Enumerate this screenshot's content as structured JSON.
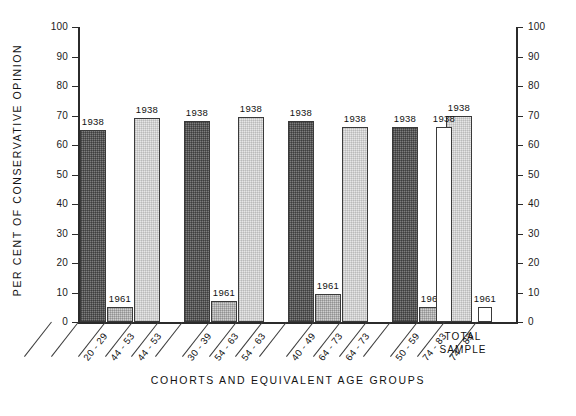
{
  "chart_data": {
    "type": "bar",
    "title": "",
    "ylabel": "PER CENT OF CONSERVATIVE OPINION",
    "xlabel": "COHORTS AND EQUIVALENT AGE GROUPS",
    "ylim": [
      0,
      100
    ],
    "ytick_labels": [
      "100",
      "90",
      "80",
      "70",
      "60",
      "50",
      "40",
      "30",
      "20",
      "10",
      "0"
    ],
    "ytick_values": [
      100,
      90,
      80,
      70,
      60,
      50,
      40,
      30,
      20,
      10,
      0
    ],
    "right_axis": true,
    "grid": false,
    "legend": "none",
    "categories": [
      "20 - 29",
      "44 - 53",
      "44 - 53",
      "30 - 39",
      "54 - 63",
      "54 - 63",
      "40 - 49",
      "64 - 73",
      "64 - 73",
      "50 - 59",
      "74 - 83",
      "74 - 83"
    ],
    "bars": [
      {
        "category": "20 - 29",
        "value": 65,
        "label": "1938",
        "fill": "dark",
        "group": 0
      },
      {
        "category": "44 - 53",
        "value": 5,
        "label": "1961",
        "fill": "light",
        "group": 0
      },
      {
        "category": "44 - 53",
        "value": 69,
        "label": "1938",
        "fill": "pale",
        "group": 0
      },
      {
        "category": "30 - 39",
        "value": 68,
        "label": "1938",
        "fill": "dark",
        "group": 1
      },
      {
        "category": "54 - 63",
        "value": 7,
        "label": "1961",
        "fill": "light",
        "group": 1
      },
      {
        "category": "54 - 63",
        "value": 69.5,
        "label": "1938",
        "fill": "pale",
        "group": 1
      },
      {
        "category": "40 - 49",
        "value": 68,
        "label": "1938",
        "fill": "dark",
        "group": 2
      },
      {
        "category": "64 - 73",
        "value": 9.5,
        "label": "1961",
        "fill": "light",
        "group": 2
      },
      {
        "category": "64 - 73",
        "value": 66,
        "label": "1938",
        "fill": "pale",
        "group": 2
      },
      {
        "category": "50 - 59",
        "value": 66,
        "label": "1938",
        "fill": "dark",
        "group": 3
      },
      {
        "category": "74 - 83",
        "value": 5,
        "label": "1961",
        "fill": "light",
        "group": 3
      },
      {
        "category": "74 - 83",
        "value": 70,
        "label": "1938",
        "fill": "pale",
        "group": 3
      }
    ],
    "total_sample": {
      "caption": "TOTAL\nSAMPLE",
      "bars": [
        {
          "value": 66,
          "label": "1938",
          "fill": "blank"
        },
        {
          "value": 5,
          "label": "1961",
          "fill": "blank"
        }
      ]
    },
    "series_labels": {
      "early": "1938",
      "late": "1961"
    },
    "colors": {
      "dark": "#7d7d7d",
      "light": "#cfcfcf",
      "pale": "#e6e6e6",
      "blank": "#ffffff",
      "axis": "#2b2b2b",
      "text": "#111111"
    }
  }
}
